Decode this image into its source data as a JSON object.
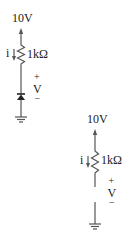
{
  "circuits": [
    {
      "id": "circuit-a",
      "supply_label": "10V",
      "current_label": "i",
      "resistor_label": "1kΩ",
      "voltage_plus": "+",
      "voltage_label": "V",
      "voltage_minus": "−",
      "element": "diode",
      "ground": "ground-symbol"
    },
    {
      "id": "circuit-b",
      "supply_label": "10V",
      "current_label": "i",
      "resistor_label": "1kΩ",
      "voltage_plus": "+",
      "voltage_label": "V",
      "voltage_minus": "−",
      "element": "open-circuit",
      "ground": "ground-symbol"
    }
  ],
  "colors": {
    "wire": "#555555",
    "text": "#222222",
    "background": "#ffffff"
  }
}
